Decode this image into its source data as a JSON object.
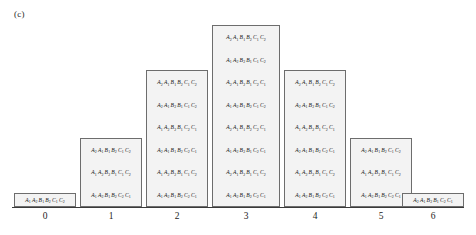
{
  "figure": {
    "panel_label": "(c)",
    "type": "labelled-histogram",
    "axis": {
      "tick_labels": [
        "0",
        "1",
        "2",
        "3",
        "4",
        "5",
        "6"
      ],
      "baseline_color": "#3a3a3a",
      "grid": false
    },
    "colors": {
      "bar_fill": "#f3f3f3",
      "bar_border": "#6d6d6d",
      "text": "#141414"
    }
  },
  "chart_data": {
    "type": "bar",
    "title": "(c)",
    "xlabel": "",
    "ylabel": "",
    "categories": [
      "0",
      "1",
      "2",
      "3",
      "4",
      "5",
      "6"
    ],
    "values": [
      1,
      3,
      6,
      8,
      6,
      3,
      1
    ],
    "ylim": [
      0,
      8
    ],
    "grid": false,
    "legend": "none"
  },
  "columns": [
    {
      "tick": "0",
      "count": 1,
      "cells": [
        [
          [
            "A",
            1
          ],
          [
            "A",
            2
          ],
          [
            "B",
            1
          ],
          [
            "B",
            2
          ],
          [
            "C",
            1
          ],
          [
            "C",
            2
          ]
        ]
      ]
    },
    {
      "tick": "1",
      "count": 3,
      "cells": [
        [
          [
            "A",
            1
          ],
          [
            "A",
            2
          ],
          [
            "B",
            1
          ],
          [
            "B",
            2
          ],
          [
            "C",
            2
          ],
          [
            "C",
            1
          ]
        ],
        [
          [
            "A",
            1
          ],
          [
            "A",
            2
          ],
          [
            "B",
            2
          ],
          [
            "B",
            1
          ],
          [
            "C",
            1
          ],
          [
            "C",
            2
          ]
        ],
        [
          [
            "A",
            2
          ],
          [
            "A",
            1
          ],
          [
            "B",
            1
          ],
          [
            "B",
            2
          ],
          [
            "C",
            1
          ],
          [
            "C",
            2
          ]
        ]
      ]
    },
    {
      "tick": "2",
      "count": 6,
      "cells": [
        [
          [
            "A",
            1
          ],
          [
            "A",
            2
          ],
          [
            "B",
            1
          ],
          [
            "B",
            2
          ],
          [
            "C",
            2
          ],
          [
            "C",
            1
          ]
        ],
        [
          [
            "A",
            1
          ],
          [
            "A",
            2
          ],
          [
            "B",
            2
          ],
          [
            "B",
            1
          ],
          [
            "C",
            1
          ],
          [
            "C",
            2
          ]
        ],
        [
          [
            "A",
            2
          ],
          [
            "A",
            1
          ],
          [
            "B",
            1
          ],
          [
            "B",
            2
          ],
          [
            "C",
            2
          ],
          [
            "C",
            1
          ]
        ],
        [
          [
            "A",
            1
          ],
          [
            "A",
            2
          ],
          [
            "B",
            2
          ],
          [
            "B",
            1
          ],
          [
            "C",
            2
          ],
          [
            "C",
            1
          ]
        ],
        [
          [
            "A",
            2
          ],
          [
            "A",
            1
          ],
          [
            "B",
            2
          ],
          [
            "B",
            1
          ],
          [
            "C",
            1
          ],
          [
            "C",
            2
          ]
        ],
        [
          [
            "A",
            2
          ],
          [
            "A",
            1
          ],
          [
            "B",
            1
          ],
          [
            "B",
            2
          ],
          [
            "C",
            1
          ],
          [
            "C",
            2
          ]
        ]
      ]
    },
    {
      "tick": "3",
      "count": 8,
      "cells": [
        [
          [
            "A",
            1
          ],
          [
            "A",
            2
          ],
          [
            "B",
            1
          ],
          [
            "B",
            2
          ],
          [
            "C",
            2
          ],
          [
            "C",
            1
          ]
        ],
        [
          [
            "A",
            2
          ],
          [
            "A",
            1
          ],
          [
            "B",
            2
          ],
          [
            "B",
            1
          ],
          [
            "C",
            1
          ],
          [
            "C",
            2
          ]
        ],
        [
          [
            "A",
            1
          ],
          [
            "A",
            2
          ],
          [
            "B",
            2
          ],
          [
            "B",
            1
          ],
          [
            "C",
            2
          ],
          [
            "C",
            1
          ]
        ],
        [
          [
            "A",
            2
          ],
          [
            "A",
            1
          ],
          [
            "B",
            1
          ],
          [
            "B",
            2
          ],
          [
            "C",
            2
          ],
          [
            "C",
            1
          ]
        ],
        [
          [
            "A",
            1
          ],
          [
            "A",
            2
          ],
          [
            "B",
            1
          ],
          [
            "B",
            2
          ],
          [
            "C",
            1
          ],
          [
            "C",
            2
          ]
        ],
        [
          [
            "A",
            2
          ],
          [
            "A",
            1
          ],
          [
            "B",
            2
          ],
          [
            "B",
            1
          ],
          [
            "C",
            2
          ],
          [
            "C",
            1
          ]
        ],
        [
          [
            "A",
            1
          ],
          [
            "A",
            2
          ],
          [
            "B",
            2
          ],
          [
            "B",
            1
          ],
          [
            "C",
            1
          ],
          [
            "C",
            2
          ]
        ],
        [
          [
            "A",
            2
          ],
          [
            "A",
            1
          ],
          [
            "B",
            1
          ],
          [
            "B",
            2
          ],
          [
            "C",
            1
          ],
          [
            "C",
            2
          ]
        ]
      ]
    },
    {
      "tick": "4",
      "count": 6,
      "cells": [
        [
          [
            "A",
            1
          ],
          [
            "A",
            2
          ],
          [
            "B",
            1
          ],
          [
            "B",
            2
          ],
          [
            "C",
            2
          ],
          [
            "C",
            1
          ]
        ],
        [
          [
            "A",
            1
          ],
          [
            "A",
            2
          ],
          [
            "B",
            2
          ],
          [
            "B",
            1
          ],
          [
            "C",
            1
          ],
          [
            "C",
            2
          ]
        ],
        [
          [
            "A",
            2
          ],
          [
            "A",
            1
          ],
          [
            "B",
            1
          ],
          [
            "B",
            2
          ],
          [
            "C",
            2
          ],
          [
            "C",
            1
          ]
        ],
        [
          [
            "A",
            1
          ],
          [
            "A",
            2
          ],
          [
            "B",
            2
          ],
          [
            "B",
            1
          ],
          [
            "C",
            2
          ],
          [
            "C",
            1
          ]
        ],
        [
          [
            "A",
            2
          ],
          [
            "A",
            1
          ],
          [
            "B",
            2
          ],
          [
            "B",
            1
          ],
          [
            "C",
            1
          ],
          [
            "C",
            2
          ]
        ],
        [
          [
            "A",
            2
          ],
          [
            "A",
            1
          ],
          [
            "B",
            1
          ],
          [
            "B",
            2
          ],
          [
            "C",
            1
          ],
          [
            "C",
            2
          ]
        ]
      ]
    },
    {
      "tick": "5",
      "count": 3,
      "cells": [
        [
          [
            "A",
            1
          ],
          [
            "A",
            2
          ],
          [
            "B",
            1
          ],
          [
            "B",
            2
          ],
          [
            "C",
            2
          ],
          [
            "C",
            1
          ]
        ],
        [
          [
            "A",
            1
          ],
          [
            "A",
            2
          ],
          [
            "B",
            2
          ],
          [
            "B",
            1
          ],
          [
            "C",
            1
          ],
          [
            "C",
            2
          ]
        ],
        [
          [
            "A",
            2
          ],
          [
            "A",
            1
          ],
          [
            "B",
            1
          ],
          [
            "B",
            2
          ],
          [
            "C",
            1
          ],
          [
            "C",
            2
          ]
        ]
      ]
    },
    {
      "tick": "6",
      "count": 1,
      "cells": [
        [
          [
            "A",
            2
          ],
          [
            "A",
            1
          ],
          [
            "B",
            2
          ],
          [
            "B",
            1
          ],
          [
            "C",
            2
          ],
          [
            "C",
            1
          ]
        ]
      ]
    }
  ],
  "layout": {
    "column_geometry": [
      {
        "left": 14,
        "width": 62
      },
      {
        "left": 80,
        "width": 62
      },
      {
        "left": 146,
        "width": 62
      },
      {
        "left": 212,
        "width": 68
      },
      {
        "left": 284,
        "width": 62
      },
      {
        "left": 350,
        "width": 62
      },
      {
        "left": 402,
        "width": 62
      }
    ],
    "tick_x": [
      45,
      111,
      177,
      246,
      315,
      381,
      433
    ]
  }
}
